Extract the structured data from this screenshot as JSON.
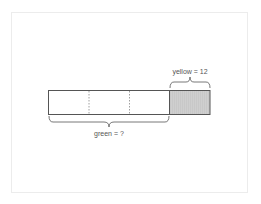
{
  "diagram": {
    "type": "tape-diagram",
    "colors": {
      "frame_border": "#ececec",
      "stroke": "#555555",
      "divider": "#888888",
      "shaded_fill": "#c8c8c8",
      "text": "#555555"
    },
    "bars": [
      {
        "name": "green",
        "segments": 3,
        "shaded": false,
        "label": "green = ?",
        "brace_position": "below"
      },
      {
        "name": "yellow",
        "segments": 1,
        "shaded": true,
        "label": "yellow = 12",
        "brace_position": "above"
      }
    ],
    "labels": {
      "green": "green = ?",
      "yellow": "yellow = 12"
    }
  }
}
